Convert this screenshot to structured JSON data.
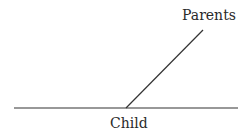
{
  "diagram": {
    "type": "line-diagram",
    "labels": {
      "parents": "Parents",
      "child": "Child"
    },
    "lines": [
      {
        "name": "baseline",
        "x1": 14,
        "y1": 108,
        "x2": 238,
        "y2": 108
      },
      {
        "name": "parents-line",
        "x1": 126,
        "y1": 108,
        "x2": 203,
        "y2": 30
      }
    ],
    "colors": {
      "line": "#333333",
      "text": "#2a2a2a",
      "background": "#ffffff"
    }
  }
}
